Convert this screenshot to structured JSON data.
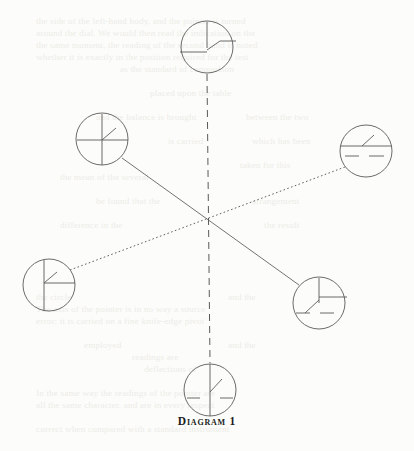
{
  "page": {
    "background_color": "#fcfcfa",
    "ink_color": "#5a5a5a",
    "caption_color": "#1c1c1c"
  },
  "figure": {
    "caption": "Diagram 1",
    "center": {
      "x": 207,
      "y": 228
    },
    "nodes": [
      {
        "id": "top",
        "name": "node-top",
        "cx": 207,
        "cy": 47,
        "r": 26,
        "label": "top-clock-node"
      },
      {
        "id": "upper-left",
        "name": "node-upper-left",
        "cx": 102,
        "cy": 139,
        "r": 26,
        "label": "upper-left-clock-node"
      },
      {
        "id": "right",
        "name": "node-right",
        "cx": 366,
        "cy": 151,
        "r": 26,
        "label": "right-clock-node"
      },
      {
        "id": "lower-left",
        "name": "node-lower-left",
        "cx": 49,
        "cy": 285,
        "r": 26,
        "label": "lower-left-clock-node"
      },
      {
        "id": "lower-right",
        "name": "node-lower-right",
        "cx": 319,
        "cy": 303,
        "r": 26,
        "label": "lower-right-clock-node"
      },
      {
        "id": "bottom",
        "name": "node-bottom",
        "cx": 210,
        "cy": 390,
        "r": 26,
        "label": "bottom-clock-node"
      }
    ],
    "connectors": [
      {
        "id": "axis-vertical",
        "name": "connector-vertical-dashed",
        "style": "dashed",
        "from": "top",
        "to": "bottom",
        "x1": 207,
        "y1": 74,
        "x2": 210,
        "y2": 363
      },
      {
        "id": "axis-solid-diagonal",
        "name": "connector-solid-diagonal",
        "style": "solid",
        "from": "upper-left",
        "to": "lower-right",
        "x1": 122,
        "y1": 158,
        "x2": 299,
        "y2": 285
      },
      {
        "id": "axis-dotted-diagonal",
        "name": "connector-dotted-diagonal",
        "style": "dotted",
        "from": "lower-left",
        "to": "right",
        "x1": 70,
        "y1": 270,
        "x2": 345,
        "y2": 167
      }
    ],
    "node_marks": {
      "top": [
        {
          "name": "vertical-stroke-up",
          "x1": 207,
          "y1": 22,
          "x2": 207,
          "y2": 48
        },
        {
          "name": "horizontal-stroke-left",
          "x1": 180,
          "y1": 52,
          "x2": 207,
          "y2": 52
        },
        {
          "name": "diagonal-stroke-upper-right",
          "x1": 207,
          "y1": 50,
          "x2": 220,
          "y2": 41
        },
        {
          "name": "horizontal-stroke-right",
          "x1": 220,
          "y1": 41,
          "x2": 236,
          "y2": 41
        }
      ],
      "upper-left": [
        {
          "name": "vertical-stroke-full",
          "x1": 102,
          "y1": 114,
          "x2": 102,
          "y2": 165
        },
        {
          "name": "horizontal-stroke-full",
          "x1": 77,
          "y1": 140,
          "x2": 128,
          "y2": 140
        },
        {
          "name": "diagonal-stroke-upper-right",
          "x1": 102,
          "y1": 140,
          "x2": 116,
          "y2": 128
        }
      ],
      "right": [
        {
          "name": "horizontal-stroke-full",
          "x1": 340,
          "y1": 146,
          "x2": 392,
          "y2": 146
        },
        {
          "name": "diagonal-stroke-upper-right",
          "x1": 362,
          "y1": 146,
          "x2": 374,
          "y2": 135
        },
        {
          "name": "dash-stroke-left",
          "x1": 345,
          "y1": 156,
          "x2": 359,
          "y2": 156
        },
        {
          "name": "dash-stroke-right",
          "x1": 369,
          "y1": 156,
          "x2": 384,
          "y2": 156
        }
      ],
      "lower-left": [
        {
          "name": "vertical-stroke-full",
          "x1": 44,
          "y1": 260,
          "x2": 44,
          "y2": 311
        },
        {
          "name": "horizontal-stroke-right",
          "x1": 44,
          "y1": 283,
          "x2": 75,
          "y2": 283
        },
        {
          "name": "diagonal-stroke-upper-right",
          "x1": 44,
          "y1": 283,
          "x2": 57,
          "y2": 272
        }
      ],
      "lower-right": [
        {
          "name": "vertical-stroke-up",
          "x1": 319,
          "y1": 278,
          "x2": 319,
          "y2": 303
        },
        {
          "name": "horizontal-stroke-right",
          "x1": 319,
          "y1": 297,
          "x2": 347,
          "y2": 297
        },
        {
          "name": "diagonal-stroke-lower-left",
          "x1": 319,
          "y1": 300,
          "x2": 305,
          "y2": 313
        },
        {
          "name": "dash-stroke-left",
          "x1": 296,
          "y1": 313,
          "x2": 310,
          "y2": 313
        },
        {
          "name": "dash-stroke-right",
          "x1": 320,
          "y1": 313,
          "x2": 334,
          "y2": 313
        }
      ],
      "bottom": [
        {
          "name": "vertical-stroke-full",
          "x1": 210,
          "y1": 364,
          "x2": 210,
          "y2": 416
        },
        {
          "name": "diagonal-stroke-upper-right",
          "x1": 210,
          "y1": 392,
          "x2": 222,
          "y2": 379
        },
        {
          "name": "dash-stroke-left",
          "x1": 187,
          "y1": 398,
          "x2": 200,
          "y2": 398
        },
        {
          "name": "dash-stroke-right",
          "x1": 220,
          "y1": 398,
          "x2": 233,
          "y2": 398
        }
      ]
    }
  },
  "ghost_text": {
    "note": "faint show-through text from the reverse side of the printed page",
    "lines": [
      {
        "x": 36,
        "y": 16,
        "text": "the side of the left-hand body, and the pointer is turned"
      },
      {
        "x": 36,
        "y": 28,
        "text": "around the dial. We would then read the indication on the"
      },
      {
        "x": 36,
        "y": 40,
        "text": "the same moment, the reading of the second hand is noted"
      },
      {
        "x": 36,
        "y": 52,
        "text": "whether it is exactly in the position required for the test"
      },
      {
        "x": 120,
        "y": 64,
        "text": "as the standard of comparison"
      },
      {
        "x": 150,
        "y": 88,
        "text": "placed upon the table"
      },
      {
        "x": 96,
        "y": 112,
        "text": "and the balance is brought"
      },
      {
        "x": 168,
        "y": 136,
        "text": "is carried"
      },
      {
        "x": 60,
        "y": 172,
        "text": "the mean of the several"
      },
      {
        "x": 246,
        "y": 112,
        "text": "between the two"
      },
      {
        "x": 252,
        "y": 136,
        "text": "which has been"
      },
      {
        "x": 240,
        "y": 160,
        "text": "taken for this"
      },
      {
        "x": 96,
        "y": 196,
        "text": "be found that the"
      },
      {
        "x": 252,
        "y": 196,
        "text": "arrangement"
      },
      {
        "x": 60,
        "y": 220,
        "text": "difference in the"
      },
      {
        "x": 264,
        "y": 220,
        "text": "the result"
      },
      {
        "x": 36,
        "y": 292,
        "text": "the circle"
      },
      {
        "x": 228,
        "y": 292,
        "text": "and the"
      },
      {
        "x": 36,
        "y": 304,
        "text": "The axis of the pointer is in no way a source"
      },
      {
        "x": 36,
        "y": 316,
        "text": "error; it is carried on a fine knife-edge pivot"
      },
      {
        "x": 84,
        "y": 340,
        "text": "employed"
      },
      {
        "x": 228,
        "y": 340,
        "text": "and the"
      },
      {
        "x": 132,
        "y": 352,
        "text": "readings are"
      },
      {
        "x": 144,
        "y": 364,
        "text": "deflections of"
      },
      {
        "x": 36,
        "y": 388,
        "text": "In the same way the readings of the pointer are"
      },
      {
        "x": 36,
        "y": 400,
        "text": "all the same character, and are in every respect"
      },
      {
        "x": 36,
        "y": 424,
        "text": "correct when compared with a standard instrument"
      }
    ]
  }
}
